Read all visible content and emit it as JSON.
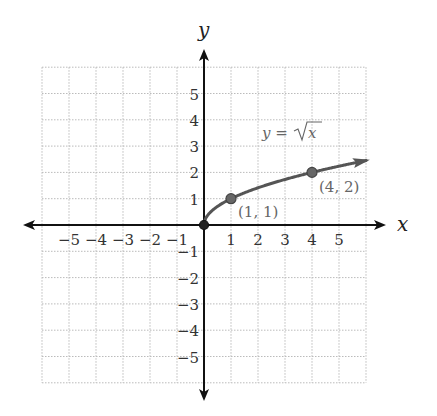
{
  "chart_data": {
    "type": "line",
    "title": "",
    "xlabel": "x",
    "ylabel": "y",
    "xlim": [
      -6,
      6
    ],
    "ylim": [
      -6,
      6
    ],
    "grid": true,
    "x_ticks": [
      "−5",
      "−4",
      "−3",
      "−2",
      "−1",
      "1",
      "2",
      "3",
      "4",
      "5"
    ],
    "x_tick_values": [
      -5,
      -4,
      -3,
      -2,
      -1,
      1,
      2,
      3,
      4,
      5
    ],
    "y_ticks": [
      "5",
      "4",
      "3",
      "2",
      "1",
      "−1",
      "−2",
      "−3",
      "−4",
      "−5"
    ],
    "y_tick_values": [
      5,
      4,
      3,
      2,
      1,
      -1,
      -2,
      -3,
      -4,
      -5
    ],
    "series": [
      {
        "name": "y = √x",
        "function": "sqrt(x)",
        "domain": [
          0,
          6
        ],
        "x": [
          0,
          0.25,
          1,
          2,
          3,
          4,
          5,
          6
        ],
        "y": [
          0,
          0.5,
          1,
          1.41,
          1.73,
          2,
          2.24,
          2.45
        ]
      }
    ],
    "points": [
      {
        "x": 0,
        "y": 0,
        "label": ""
      },
      {
        "x": 1,
        "y": 1,
        "label": "(1, 1)"
      },
      {
        "x": 4,
        "y": 2,
        "label": "(4, 2)"
      }
    ],
    "annotations": [
      {
        "text_prefix": "y = ",
        "text_radical": "x",
        "full": "y = √x"
      }
    ],
    "colors": {
      "curve": "#555555",
      "axis": "#111111",
      "grid": "#bbbbbb",
      "annotation": "#666666"
    }
  },
  "labels": {
    "x_axis": "x",
    "y_axis": "y",
    "function": "y = √x",
    "point_1": "(1, 1)",
    "point_2": "(4, 2)"
  }
}
